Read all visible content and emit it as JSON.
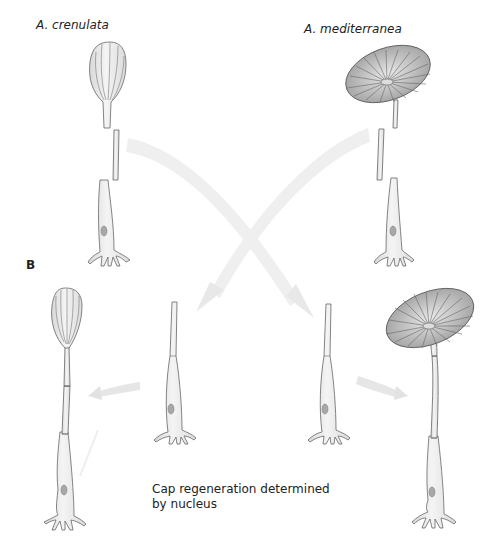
{
  "labels": {
    "species_left": "A. crenulata",
    "species_right": "A. mediterranea",
    "panel": "B",
    "caption_line1": "Cap regeneration determined",
    "caption_line2": "by nucleus"
  },
  "colors": {
    "cell_fill": "#ececec",
    "cell_stroke": "#666666",
    "nucleus_fill": "#a8a8a8",
    "arrow_fill": "#eeeeee",
    "cap_fill": "#c9c9c9",
    "text": "#222222"
  },
  "figure": {
    "top_row": [
      {
        "species": "A. crenulata",
        "parts": [
          "cap",
          "stalk-segment",
          "base-with-nucleus"
        ]
      },
      {
        "species": "A. mediterranea",
        "parts": [
          "cap",
          "stalk-segment",
          "base-with-nucleus"
        ]
      }
    ],
    "bottom_row": [
      {
        "description": "regenerated crenulata-type cap on base with nucleus"
      },
      {
        "description": "grafted stalk on crenulata base"
      },
      {
        "description": "grafted stalk on mediterranea base"
      },
      {
        "description": "regenerated mediterranea-type cap on base with nucleus"
      }
    ],
    "arrows": [
      "crenulata stalk to mediterranea base",
      "mediterranea stalk to crenulata base",
      "left regeneration",
      "right regeneration"
    ]
  }
}
